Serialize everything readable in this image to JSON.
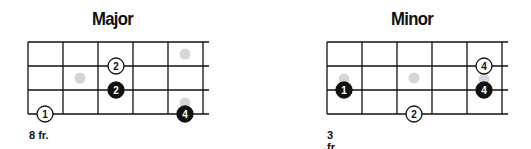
{
  "diagrams": [
    {
      "title": "Major",
      "fret_label": "8 fr.",
      "grid": {
        "left": 28,
        "top": 42,
        "fret_width": 35,
        "string_spacing": 24,
        "frets": 5,
        "strings": 4,
        "extend_right": 6
      },
      "ghost_dots": [
        {
          "x": 185,
          "y": 54
        },
        {
          "x": 80,
          "y": 78
        },
        {
          "x": 185,
          "y": 103
        }
      ],
      "notes": [
        {
          "x": 116,
          "y": 66,
          "label": "2",
          "style": "open"
        },
        {
          "x": 116,
          "y": 90,
          "label": "2",
          "style": "filled"
        },
        {
          "x": 45,
          "y": 114,
          "label": "1",
          "style": "open"
        },
        {
          "x": 185,
          "y": 114,
          "label": "4",
          "style": "filled"
        }
      ]
    },
    {
      "title": "Minor",
      "fret_label": "3 fr.",
      "grid": {
        "left": 327,
        "top": 42,
        "fret_width": 35,
        "string_spacing": 24,
        "frets": 5,
        "strings": 4,
        "extend_right": 6
      },
      "ghost_dots": [
        {
          "x": 344,
          "y": 79
        },
        {
          "x": 414,
          "y": 78
        },
        {
          "x": 484,
          "y": 79
        }
      ],
      "notes": [
        {
          "x": 484,
          "y": 66,
          "label": "4",
          "style": "open"
        },
        {
          "x": 344,
          "y": 90,
          "label": "1",
          "style": "filled"
        },
        {
          "x": 484,
          "y": 90,
          "label": "4",
          "style": "filled"
        },
        {
          "x": 414,
          "y": 114,
          "label": "2",
          "style": "open"
        }
      ]
    }
  ],
  "colors": {
    "line": "#111111",
    "filled_note": "#111111",
    "open_note_fill": "#ffffff",
    "ghost_dot": "#d6d6d6"
  }
}
